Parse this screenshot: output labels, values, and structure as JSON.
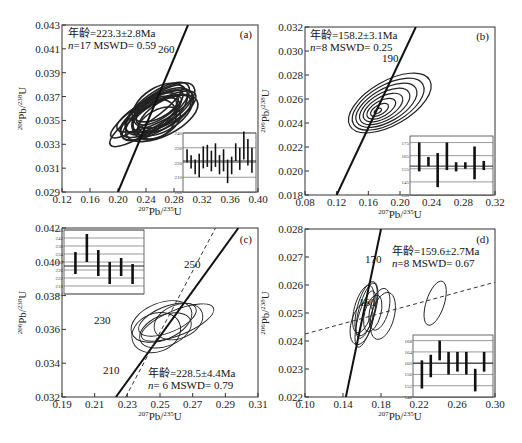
{
  "chart_data": [
    {
      "panel": "(a)",
      "type": "scatter",
      "subtype": "concordia-ellipse",
      "xlabel": "207Pb/235U",
      "ylabel": "206Pb/238U",
      "xlim": [
        0.12,
        0.4
      ],
      "ylim": [
        0.029,
        0.043
      ],
      "xticks": [
        "0.12",
        "0.16",
        "0.20",
        "0.24",
        "0.28",
        "0.32",
        "0.36",
        "0.40"
      ],
      "yticks": [
        "0.029",
        "0.031",
        "0.033",
        "0.035",
        "0.037",
        "0.039",
        "0.041",
        "0.043"
      ],
      "annotation_age": "年龄=223.3±2.8Ma",
      "annotation_stats": "n=17 MSWD= 0.59",
      "concordia_labels": [
        "260"
      ],
      "concordia_line": [
        [
          0.2,
          0.029
        ],
        [
          0.3,
          0.043
        ]
      ],
      "ellipse_cluster_center": [
        0.255,
        0.0355
      ],
      "ellipse_count": 17,
      "inset": {
        "type": "bar",
        "ylim": [
          200,
          240
        ],
        "yticks": [
          "200",
          "210",
          "220",
          "230",
          "240"
        ],
        "mean": 221,
        "bars": [
          [
            220,
            229
          ],
          [
            216,
            225
          ],
          [
            212,
            222
          ],
          [
            210,
            226
          ],
          [
            216,
            231
          ],
          [
            217,
            232
          ],
          [
            214,
            228
          ],
          [
            217,
            233
          ],
          [
            212,
            225
          ],
          [
            214,
            229
          ],
          [
            206,
            222
          ],
          [
            212,
            224
          ],
          [
            221,
            233
          ],
          [
            215,
            230
          ],
          [
            222,
            241
          ],
          [
            218,
            236
          ],
          [
            213,
            230
          ]
        ]
      }
    },
    {
      "panel": "(b)",
      "type": "scatter",
      "subtype": "concordia-ellipse",
      "xlabel": "207Pb/235U",
      "ylabel": "206Pb/238U",
      "xlim": [
        0.08,
        0.32
      ],
      "ylim": [
        0.018,
        0.032
      ],
      "xticks": [
        "0.08",
        "0.12",
        "0.16",
        "0.20",
        "0.24",
        "0.28",
        "0.32"
      ],
      "yticks": [
        "0.018",
        "0.020",
        "0.022",
        "0.024",
        "0.026",
        "0.028",
        "0.030",
        "0.032"
      ],
      "annotation_age": "年龄=158.2±3.1Ma",
      "annotation_stats": "n=8 MSWD= 0.25",
      "concordia_labels": [
        "190"
      ],
      "concordia_line": [
        [
          0.12,
          0.018
        ],
        [
          0.22,
          0.032
        ]
      ],
      "ellipse_cluster_center": [
        0.172,
        0.025
      ],
      "ellipse_count": 8,
      "inset": {
        "type": "bar",
        "ylim": [
          135,
          180
        ],
        "yticks": [
          "135",
          "145",
          "155",
          "165",
          "175"
        ],
        "mean": 157,
        "bars": [
          [
            153,
            175
          ],
          [
            157,
            164
          ],
          [
            141,
            167
          ],
          [
            154,
            175
          ],
          [
            153,
            160
          ],
          [
            155,
            160
          ],
          [
            147,
            172
          ],
          [
            154,
            161
          ]
        ]
      }
    },
    {
      "panel": "(c)",
      "type": "scatter",
      "subtype": "concordia-ellipse",
      "xlabel": "207Pb/235U",
      "ylabel": "206Pb/238U",
      "xlim": [
        0.19,
        0.31
      ],
      "ylim": [
        0.032,
        0.042
      ],
      "xticks": [
        "0.19",
        "0.21",
        "0.23",
        "0.25",
        "0.27",
        "0.29",
        "0.31"
      ],
      "yticks": [
        "0.032",
        "0.034",
        "0.036",
        "0.038",
        "0.040",
        "0.042"
      ],
      "annotation_age": "年龄=228.5±4.4Ma",
      "annotation_stats": "n= 6 MSWD= 0.79",
      "concordia_labels": [
        "250",
        "230",
        "210"
      ],
      "concordia_line": [
        [
          0.223,
          0.032
        ],
        [
          0.298,
          0.042
        ]
      ],
      "discordia_line_dashed": [
        [
          0.229,
          0.032
        ],
        [
          0.284,
          0.042
        ]
      ],
      "ellipse_cluster_center": [
        0.255,
        0.0362
      ],
      "ellipse_count": 6,
      "inset": {
        "type": "bar",
        "ylim": [
          214,
          246
        ],
        "yticks": [
          "214",
          "218",
          "222",
          "226",
          "230",
          "234",
          "238",
          "242",
          "246"
        ],
        "mean": 228,
        "bars": [
          [
            224,
            235
          ],
          [
            230,
            244
          ],
          [
            223,
            236
          ],
          [
            219,
            230
          ],
          [
            223,
            232
          ],
          [
            219,
            229
          ]
        ]
      }
    },
    {
      "panel": "(d)",
      "type": "scatter",
      "subtype": "concordia-ellipse",
      "xlabel": "207Pb/235U",
      "ylabel": "206Pb/238U",
      "xlim": [
        0.1,
        0.3
      ],
      "ylim": [
        0.022,
        0.028
      ],
      "xticks": [
        "0.10",
        "0.14",
        "0.18",
        "0.22",
        "0.26",
        "0.30"
      ],
      "yticks": [
        "0.022",
        "0.023",
        "0.024",
        "0.025",
        "0.026",
        "0.027",
        "0.028"
      ],
      "annotation_age": "年龄=159.6±2.7Ma",
      "annotation_stats": "n=8 MSWD= 0.67",
      "concordia_labels": [
        "170",
        "160"
      ],
      "concordia_line": [
        [
          0.143,
          0.022
        ],
        [
          0.18,
          0.028
        ]
      ],
      "discordia_line_dashed": [
        [
          0.1,
          0.02425
        ],
        [
          0.3,
          0.0261
        ]
      ],
      "ellipse_cluster_center": [
        0.168,
        0.0249
      ],
      "ellipse_count": 8,
      "inset": {
        "type": "bar",
        "ylim": [
          148,
          170
        ],
        "yticks": [
          "148",
          "152",
          "156",
          "160",
          "164",
          "168"
        ],
        "mean": 160,
        "bars": [
          [
            151,
            161
          ],
          [
            155,
            163
          ],
          [
            161,
            168
          ],
          [
            156,
            164
          ],
          [
            157,
            164
          ],
          [
            156,
            164
          ],
          [
            150,
            158
          ],
          [
            157,
            164
          ]
        ]
      }
    }
  ],
  "panels": {
    "a": {
      "label": "(a)",
      "age": "年龄=223.3±2.8Ma",
      "stats_n": "n",
      "stats_rest": "=17 MSWD= 0.59",
      "conc1": "260"
    },
    "b": {
      "label": "(b)",
      "age": "年龄=158.2±3.1Ma",
      "stats_n": "n",
      "stats_rest": "=8 MSWD= 0.25",
      "conc1": "190"
    },
    "c": {
      "label": "(c)",
      "age": "年龄=228.5±4.4Ma",
      "stats_n": "n",
      "stats_rest": "= 6 MSWD= 0.79",
      "conc1": "250",
      "conc2": "230",
      "conc3": "210"
    },
    "d": {
      "label": "(d)",
      "age": "年龄=159.6±2.7Ma",
      "stats_n": "n",
      "stats_rest": "=8 MSWD= 0.67",
      "conc1": "170",
      "conc2": "160"
    }
  },
  "axis": {
    "x_sup": "207",
    "x_main": "Pb/",
    "x_sup2": "235",
    "x_end": "U",
    "y_sup": "206",
    "y_main": "Pb/",
    "y_sup2": "238",
    "y_end": "U"
  }
}
